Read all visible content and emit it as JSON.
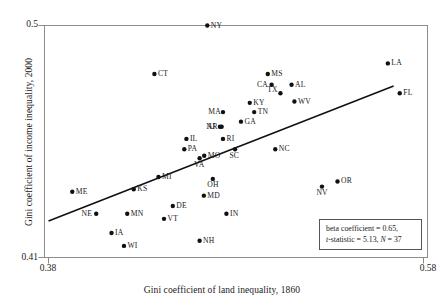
{
  "chart_data": {
    "type": "scatter",
    "title": "",
    "xlabel": "Gini coefficient of land inequality, 1860",
    "ylabel": "Gini coefficient of income inequality, 2000",
    "xlim": [
      0.38,
      0.58
    ],
    "ylim": [
      0.41,
      0.5
    ],
    "xticks": [
      "0.38",
      "0.58"
    ],
    "yticks": [
      "0.41",
      "0.5"
    ],
    "grid": false,
    "legend_position": "none",
    "point_color": "#111111",
    "line_color": "#111111",
    "annotation": {
      "beta_line": "beta coefficient = 0.65,",
      "stat_line_prefix": "t",
      "stat_line_rest": "-statistic = 5.13, ",
      "n_prefix": "N",
      "n_rest": " = 37"
    },
    "regression_line": {
      "x_start": 0.3821,
      "y_start": 0.4242,
      "x_end": 0.5623,
      "y_end": 0.4765
    },
    "points": [
      {
        "label": "NY",
        "x": 0.465,
        "y": 0.5,
        "label_pos": "right"
      },
      {
        "label": "LA",
        "x": 0.5593,
        "y": 0.4853,
        "label_pos": "right"
      },
      {
        "label": "CT",
        "x": 0.4374,
        "y": 0.4812,
        "label_pos": "right"
      },
      {
        "label": "MS",
        "x": 0.4966,
        "y": 0.4812,
        "label_pos": "right"
      },
      {
        "label": "CA",
        "x": 0.4986,
        "y": 0.477,
        "label_pos": "left"
      },
      {
        "label": "AL",
        "x": 0.509,
        "y": 0.477,
        "label_pos": "right"
      },
      {
        "label": "TX",
        "x": 0.5032,
        "y": 0.4737,
        "label_pos": "left-below"
      },
      {
        "label": "FL",
        "x": 0.5655,
        "y": 0.4737,
        "label_pos": "right"
      },
      {
        "label": "KY",
        "x": 0.4872,
        "y": 0.47,
        "label_pos": "right"
      },
      {
        "label": "WV",
        "x": 0.5105,
        "y": 0.4705,
        "label_pos": "right"
      },
      {
        "label": "TN",
        "x": 0.4895,
        "y": 0.4664,
        "label_pos": "right"
      },
      {
        "label": "MA",
        "x": 0.4732,
        "y": 0.4664,
        "label_pos": "left"
      },
      {
        "label": "GA",
        "x": 0.4826,
        "y": 0.4627,
        "label_pos": "right"
      },
      {
        "label": "AR",
        "x": 0.4725,
        "y": 0.4607,
        "label_pos": "left"
      },
      {
        "label": "NJ",
        "x": 0.4716,
        "y": 0.4607,
        "label_pos": "left-sm"
      },
      {
        "label": "RI",
        "x": 0.4732,
        "y": 0.456,
        "label_pos": "right"
      },
      {
        "label": "SC",
        "x": 0.4795,
        "y": 0.452,
        "label_pos": "below"
      },
      {
        "label": "IL",
        "x": 0.4541,
        "y": 0.456,
        "label_pos": "right"
      },
      {
        "label": "PA",
        "x": 0.453,
        "y": 0.452,
        "label_pos": "right"
      },
      {
        "label": "NC",
        "x": 0.5005,
        "y": 0.452,
        "label_pos": "right"
      },
      {
        "label": "MO",
        "x": 0.4634,
        "y": 0.4495,
        "label_pos": "right"
      },
      {
        "label": "VA",
        "x": 0.461,
        "y": 0.4485,
        "label_pos": "below"
      },
      {
        "label": "OH",
        "x": 0.4679,
        "y": 0.4405,
        "label_pos": "below"
      },
      {
        "label": "MI",
        "x": 0.4395,
        "y": 0.4412,
        "label_pos": "right"
      },
      {
        "label": "OR",
        "x": 0.533,
        "y": 0.4395,
        "label_pos": "right"
      },
      {
        "label": "NV",
        "x": 0.5249,
        "y": 0.4375,
        "label_pos": "below"
      },
      {
        "label": "KS",
        "x": 0.4266,
        "y": 0.4365,
        "label_pos": "right"
      },
      {
        "label": "ME",
        "x": 0.3945,
        "y": 0.4355,
        "label_pos": "right"
      },
      {
        "label": "MD",
        "x": 0.4632,
        "y": 0.434,
        "label_pos": "right"
      },
      {
        "label": "DE",
        "x": 0.447,
        "y": 0.43,
        "label_pos": "right"
      },
      {
        "label": "NE",
        "x": 0.407,
        "y": 0.427,
        "label_pos": "left"
      },
      {
        "label": "MN",
        "x": 0.4232,
        "y": 0.427,
        "label_pos": "right"
      },
      {
        "label": "IN",
        "x": 0.475,
        "y": 0.427,
        "label_pos": "right"
      },
      {
        "label": "VT",
        "x": 0.4424,
        "y": 0.425,
        "label_pos": "right"
      },
      {
        "label": "IA",
        "x": 0.415,
        "y": 0.4195,
        "label_pos": "right"
      },
      {
        "label": "WI",
        "x": 0.4215,
        "y": 0.4145,
        "label_pos": "right"
      },
      {
        "label": "NH",
        "x": 0.461,
        "y": 0.4165,
        "label_pos": "right"
      }
    ]
  }
}
